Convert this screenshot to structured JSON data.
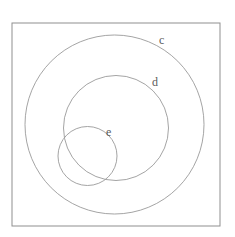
{
  "figure": {
    "background_color": "#ffffff",
    "line_color": "#9a9a9a",
    "frame_line_color": "#8f8f8f",
    "label_color": "#5a5a5a",
    "frame": {
      "x": 12,
      "y": 23,
      "width": 208,
      "height": 203
    },
    "sets": [
      {
        "label": "c",
        "cx": 114.5,
        "cy": 124.5,
        "r": 89.5,
        "label_x": 159,
        "label_y": 44
      },
      {
        "label": "d",
        "cx": 116,
        "cy": 128,
        "r": 52.5,
        "label_x": 152,
        "label_y": 86
      },
      {
        "label": "e",
        "cx": 87.5,
        "cy": 156,
        "r": 29.5,
        "label_x": 106,
        "label_y": 136
      }
    ]
  }
}
